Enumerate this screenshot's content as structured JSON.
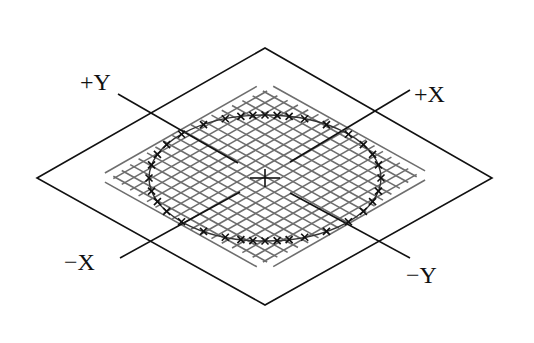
{
  "diagram": {
    "plane": {
      "corners": {
        "left": [
          37,
          178
        ],
        "top": [
          265,
          48
        ],
        "right": [
          492,
          178
        ],
        "bottom": [
          265,
          305
        ]
      },
      "edge_color": "#111111",
      "grid_color": "#6e6e6e",
      "grid_count": 19
    },
    "ellipse": {
      "cx": 265,
      "cy": 178,
      "rx": 116,
      "ry": 63,
      "color": "#111111",
      "marker": "x",
      "marker_count": 28
    },
    "center_mark": "cross",
    "axes": [
      {
        "id": "plus-y",
        "label": "+Y",
        "from": [
          118,
          94
        ],
        "to": [
          238,
          163
        ],
        "label_pos": [
          80,
          90
        ]
      },
      {
        "id": "plus-x",
        "label": "+X",
        "from": [
          410,
          90
        ],
        "to": [
          290,
          162
        ],
        "label_pos": [
          414,
          102
        ]
      },
      {
        "id": "minus-x",
        "label": "−X",
        "from": [
          120,
          258
        ],
        "to": [
          240,
          192
        ],
        "label_pos": [
          64,
          270
        ]
      },
      {
        "id": "minus-y",
        "label": "−Y",
        "from": [
          410,
          258
        ],
        "to": [
          290,
          193
        ],
        "label_pos": [
          406,
          283
        ]
      }
    ]
  }
}
